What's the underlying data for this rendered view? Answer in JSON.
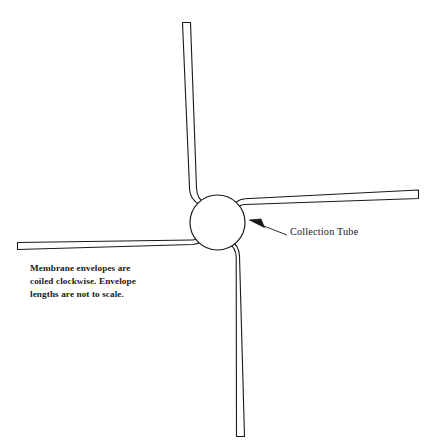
{
  "figure": {
    "background_color": "#ffffff",
    "stroke_color": "#1a1a1a",
    "title": ""
  },
  "hub": {
    "name": "collection tube",
    "shape": "circle",
    "center_x": 217,
    "center_y": 222,
    "diameter": 55
  },
  "envelopes": [
    {
      "id": "envelope-top",
      "direction": "up",
      "tip_x": 190,
      "tip_y": 22,
      "width": 9
    },
    {
      "id": "envelope-right",
      "direction": "right",
      "tip_x": 419,
      "tip_y": 191,
      "width": 9
    },
    {
      "id": "envelope-bottom",
      "direction": "down",
      "tip_x": 245,
      "tip_y": 437,
      "width": 9
    },
    {
      "id": "envelope-left",
      "direction": "left",
      "tip_x": 17,
      "tip_y": 250,
      "width": 9
    }
  ],
  "callout": {
    "label": "Collection Tube",
    "arrow_tip_x": 250,
    "arrow_tip_y": 221,
    "leader_end_x": 287,
    "leader_end_y": 235
  },
  "note": {
    "line1": "Membrane envelopes are",
    "line2": "coiled clockwise.  Envelope",
    "line3": "lengths are not to scale."
  }
}
